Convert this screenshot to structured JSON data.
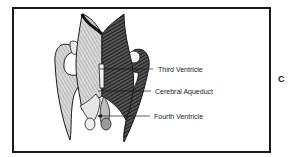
{
  "figure": {
    "panel_letter": "C",
    "labels": [
      {
        "text": "Third Ventricle",
        "x": 158,
        "y": 66
      },
      {
        "text": "Cerebral Aqueduct",
        "x": 155,
        "y": 91
      },
      {
        "text": "Fourth Ventricle",
        "x": 154,
        "y": 113
      }
    ],
    "colors": {
      "line": "#1a1a1a",
      "shade": "#2b2b2b",
      "paper": "#ffffff"
    }
  }
}
